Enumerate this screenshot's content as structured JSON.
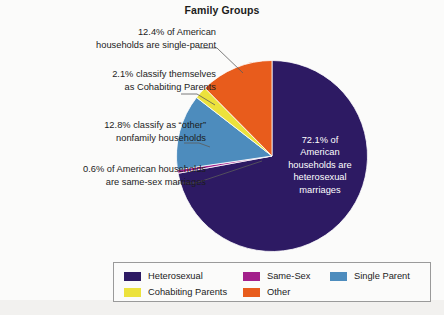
{
  "chart_data": {
    "type": "pie",
    "title": "Family Groups",
    "categories": [
      "Heterosexual",
      "Same-Sex",
      "Single Parent",
      "Cohabiting Parents",
      "Other"
    ],
    "values": [
      72.1,
      0.6,
      12.8,
      2.1,
      12.4
    ],
    "units": "percent",
    "colors": [
      "#2d1a63",
      "#a3208b",
      "#4d8cbd",
      "#ece23c",
      "#e85c1c"
    ],
    "start_angle_deg": 0,
    "direction": "clockwise",
    "legend_position": "bottom",
    "grid": false,
    "annotations": [
      "12.4% of American households are single-parent",
      "2.1% classify themselves as Cohabiting Parents",
      "12.8% classify as “other” nonfamily households",
      "0.6% of American households are same-sex marriages",
      "72.1% of American households are heterosexual marriages"
    ]
  },
  "title": "Family Groups",
  "callouts": {
    "single_parent": "12.4% of American\nhouseholds are single-parent",
    "cohabiting": "2.1% classify themselves\nas Cohabiting Parents",
    "other": "12.8% classify as “other”\nnonfamily households",
    "same_sex": "0.6% of American households\nare same-sex marriages",
    "heterosexual": "72.1% of\nAmerican\nhouseholds are\nheterosexual\nmarriages"
  },
  "legend": {
    "items": [
      {
        "label": "Heterosexual",
        "color": "#2d1a63"
      },
      {
        "label": "Same-Sex",
        "color": "#a3208b"
      },
      {
        "label": "Single Parent",
        "color": "#4d8cbd"
      },
      {
        "label": "Cohabiting Parents",
        "color": "#ece23c"
      },
      {
        "label": "Other",
        "color": "#e85c1c"
      }
    ]
  }
}
